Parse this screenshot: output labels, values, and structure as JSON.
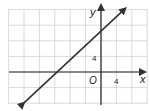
{
  "chart_data": {
    "type": "line",
    "title": "",
    "xlabel": "x",
    "ylabel": "y",
    "origin_label": "O",
    "x_tick_labels": [
      {
        "value": 4,
        "label": "4"
      }
    ],
    "y_tick_labels": [
      {
        "value": 4,
        "label": "4"
      }
    ],
    "grid": true,
    "grid_step": 2,
    "xlim": [
      -12,
      6
    ],
    "ylim": [
      -4,
      8
    ],
    "series": [
      {
        "name": "line",
        "equation": "y = x + 6",
        "slope": 1,
        "y_intercept": 6,
        "x_intercept": -6,
        "x": [
          -10,
          2
        ],
        "y": [
          -4,
          8
        ],
        "arrows": "both"
      }
    ]
  },
  "colors": {
    "grid": "#d0d0d0",
    "axis": "#222222",
    "line": "#333333"
  }
}
